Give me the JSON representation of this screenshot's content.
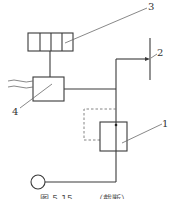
{
  "diagram": {
    "labels": {
      "component_1": "1",
      "component_2": "2",
      "component_3": "3",
      "component_4": "4"
    },
    "caption": "图 5-15 ……（截断）"
  }
}
